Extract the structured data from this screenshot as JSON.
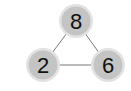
{
  "diagram": {
    "type": "number-triangle",
    "colors": {
      "node_fill": "#c4c4c4",
      "node_ring": "#e2e2e2",
      "edge": "#777777",
      "text": "#111111"
    },
    "nodes": [
      {
        "id": "top",
        "label": "8",
        "cx": 76,
        "cy": 21
      },
      {
        "id": "bottom-left",
        "label": "2",
        "cx": 43,
        "cy": 65
      },
      {
        "id": "bottom-right",
        "label": "6",
        "cx": 108,
        "cy": 65
      }
    ],
    "edges": [
      {
        "from": "top",
        "to": "bottom-left"
      },
      {
        "from": "top",
        "to": "bottom-right"
      },
      {
        "from": "bottom-left",
        "to": "bottom-right"
      }
    ]
  }
}
